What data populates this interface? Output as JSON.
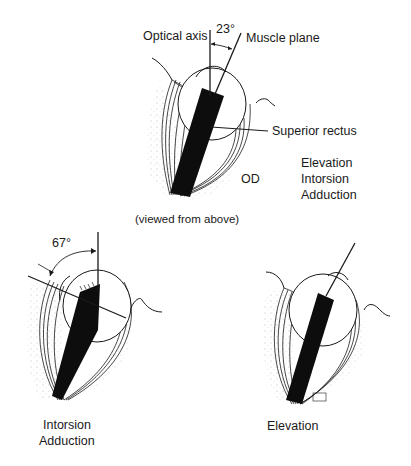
{
  "top_figure": {
    "optical_axis_label": "Optical axis",
    "angle_label": "23°",
    "muscle_plane_label": "Muscle plane",
    "muscle_label": "Superior rectus",
    "eye_label": "OD",
    "actions": [
      "Elevation",
      "Intorsion",
      "Adduction"
    ],
    "caption": "(viewed from above)"
  },
  "bottom_left_figure": {
    "angle_label": "67°",
    "actions": [
      "Intorsion",
      "Adduction"
    ]
  },
  "bottom_right_figure": {
    "actions": [
      "Elevation"
    ]
  },
  "colors": {
    "ink": "#1a1a1a",
    "background": "#ffffff"
  }
}
